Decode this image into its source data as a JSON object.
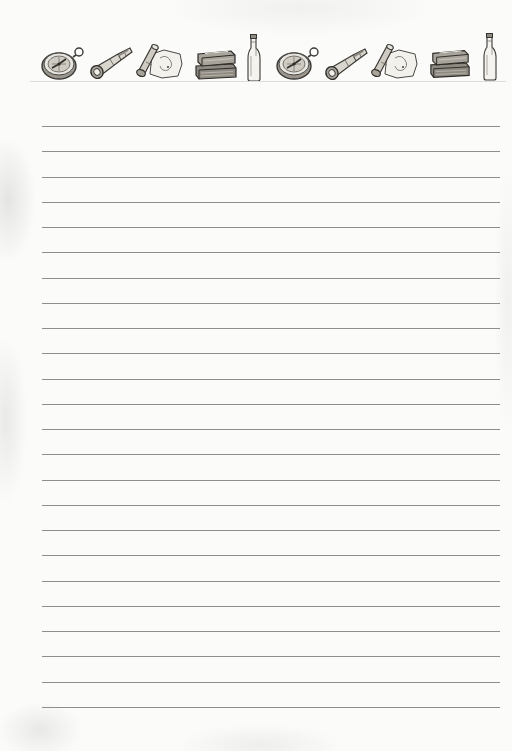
{
  "page": {
    "type": "lined-notepaper",
    "background_color": "#fbfbfa",
    "line_color": "#8e8e8c",
    "line_count": 24,
    "first_line_y": 126,
    "line_spacing": 25.25,
    "line_left": 42,
    "line_right": 500
  },
  "header": {
    "icons": [
      {
        "name": "compass-icon",
        "x": 40,
        "y": 45,
        "w": 46,
        "h": 36
      },
      {
        "name": "spyglass-icon",
        "x": 88,
        "y": 46,
        "w": 44,
        "h": 34
      },
      {
        "name": "treasure-map-icon",
        "x": 134,
        "y": 42,
        "w": 50,
        "h": 38
      },
      {
        "name": "books-icon",
        "x": 193,
        "y": 48,
        "w": 46,
        "h": 32
      },
      {
        "name": "bottle-icon",
        "x": 246,
        "y": 34,
        "w": 16,
        "h": 48
      },
      {
        "name": "compass-icon",
        "x": 275,
        "y": 45,
        "w": 46,
        "h": 36
      },
      {
        "name": "spyglass-icon",
        "x": 323,
        "y": 47,
        "w": 44,
        "h": 34
      },
      {
        "name": "treasure-map-icon",
        "x": 369,
        "y": 42,
        "w": 50,
        "h": 38
      },
      {
        "name": "books-icon",
        "x": 428,
        "y": 47,
        "w": 44,
        "h": 32
      },
      {
        "name": "bottle-icon",
        "x": 482,
        "y": 33,
        "w": 16,
        "h": 48
      }
    ]
  }
}
